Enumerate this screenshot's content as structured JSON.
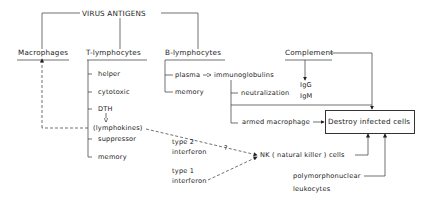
{
  "title": "VIRUS ANTIGENS",
  "columns": {
    "macrophages": {
      "label": "Macrophages"
    },
    "t_lymphocytes": {
      "label": "T-lymphocytes",
      "items": [
        "helper",
        "cytotoxic",
        "DTH",
        "(lymphokines)",
        "suppressor",
        "memory"
      ]
    },
    "b_lymphocytes": {
      "label": "B-lymphocytes",
      "items": [
        "plasma",
        "memory"
      ]
    },
    "complement": {
      "label": "Complement"
    }
  },
  "mechanisms": {
    "immunoglobulins": "immunoglobulins",
    "neutralization": "neutralization",
    "armed_macrophage": "armed macrophage",
    "igg": "IgG",
    "igm": "IgM"
  },
  "interferons": {
    "type2_line1": "type 2",
    "type2_line2": "interferon",
    "type1_line1": "type 1",
    "type1_line2": "interferon",
    "uncertain": "?"
  },
  "nk_cells": "NK ( natural killer ) cells",
  "pmn": {
    "line1": "polymorphonuclear",
    "line2": "leukocytes"
  },
  "target": "Destroy infected cells",
  "colors": {
    "line": "#333333",
    "text": "#1a1a1a",
    "background": "#ffffff"
  }
}
